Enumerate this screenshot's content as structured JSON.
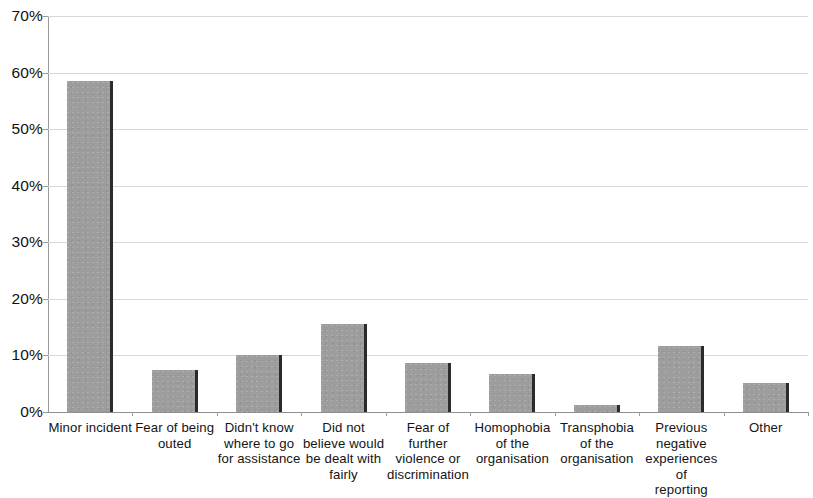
{
  "chart_data": {
    "type": "bar",
    "title": "",
    "xlabel": "",
    "ylabel": "",
    "ylim": [
      0,
      70
    ],
    "y_tick_labels": [
      "0%",
      "10%",
      "20%",
      "30%",
      "40%",
      "50%",
      "60%",
      "70%"
    ],
    "y_ticks": [
      0,
      10,
      20,
      30,
      40,
      50,
      60,
      70
    ],
    "grid": "horizontal",
    "legend": "none",
    "bar_color": "#9d9d9d",
    "categories": [
      "Minor incident",
      "Fear of being outed",
      "Didn't know where to go for assistance",
      "Did not believe would be dealt with fairly",
      "Fear of further violence or discrimination",
      "Homophobia of the organisation",
      "Transphobia of the organisation",
      "Previous negative experiences of reporting",
      "Other"
    ],
    "category_lines": [
      [
        "Minor incident"
      ],
      [
        "Fear of being",
        "outed"
      ],
      [
        "Didn't know",
        "where to go",
        "for assistance"
      ],
      [
        "Did not",
        "believe would",
        "be dealt with",
        "fairly"
      ],
      [
        "Fear of",
        "further",
        "violence or",
        "discrimination"
      ],
      [
        "Homophobia",
        "of the",
        "organisation"
      ],
      [
        "Transphobia",
        "of the",
        "organisation"
      ],
      [
        "Previous",
        "negative",
        "experiences of",
        "reporting"
      ],
      [
        "Other"
      ]
    ],
    "values": [
      58.5,
      7.5,
      10,
      15.5,
      8.7,
      6.7,
      1.2,
      11.7,
      5.2
    ]
  }
}
